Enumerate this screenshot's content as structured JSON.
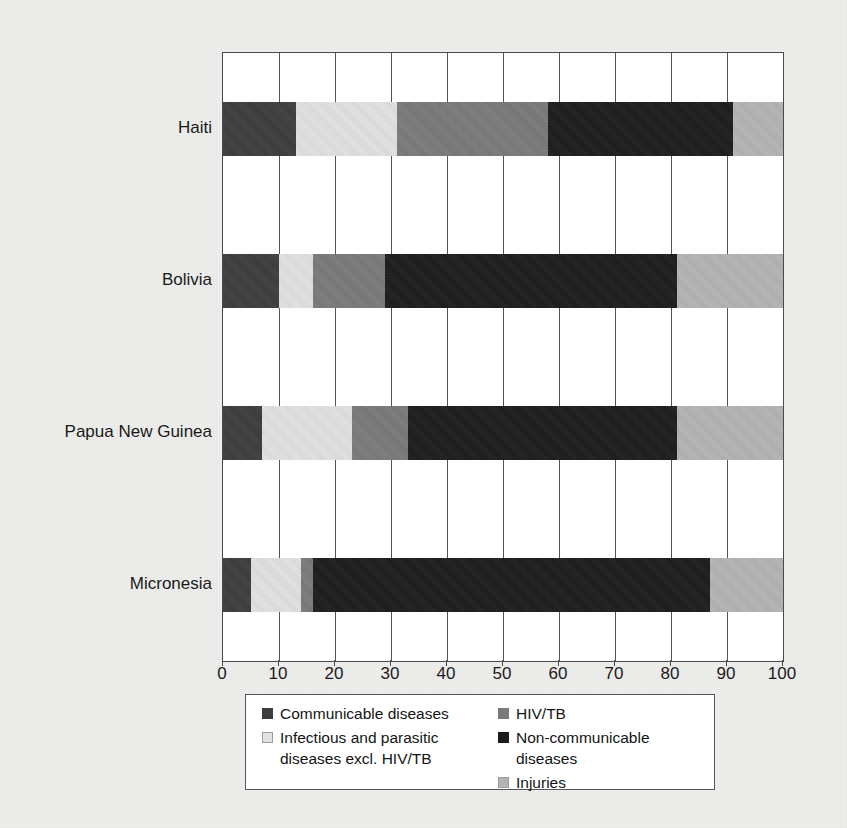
{
  "chart_data": {
    "type": "bar",
    "orientation": "horizontal",
    "stacked": true,
    "normalized_percent": true,
    "title": "",
    "subtitle": "",
    "xlabel": "",
    "ylabel": "",
    "xlim": [
      0,
      100
    ],
    "grid": true,
    "legend_position": "bottom",
    "xticks": [
      0,
      10,
      20,
      30,
      40,
      50,
      60,
      70,
      80,
      90,
      100
    ],
    "xtick_labels": [
      "0",
      "10",
      "20",
      "30",
      "40",
      "50",
      "60",
      "70",
      "80",
      "90",
      "100"
    ],
    "categories": [
      "Haiti",
      "Bolivia",
      "Papua New Guinea",
      "Micronesia"
    ],
    "series": [
      {
        "name": "Communicable diseases",
        "color": "#3d3d3d",
        "values": [
          13,
          10,
          7,
          5
        ]
      },
      {
        "name": "Infectious and parasitic diseases excl. HIV/TB",
        "color": "#e2e2e2",
        "values": [
          18,
          6,
          16,
          9
        ]
      },
      {
        "name": "HIV/TB",
        "color": "#7a7a7a",
        "values": [
          27,
          13,
          10,
          2
        ]
      },
      {
        "name": "Non-communicable diseases",
        "color": "#1c1c1c",
        "values": [
          33,
          52,
          48,
          71
        ]
      },
      {
        "name": "Injuries",
        "color": "#b4b4b4",
        "values": [
          9,
          19,
          19,
          13
        ]
      }
    ]
  },
  "legend": {
    "entries": [
      {
        "label": "Communicable diseases",
        "color": "#3d3d3d",
        "column": 0
      },
      {
        "label": "HIV/TB",
        "color": "#7a7a7a",
        "column": 1
      },
      {
        "label": "Infectious and parasitic\ndiseases excl. HIV/TB",
        "color": "#e2e2e2",
        "column": 0
      },
      {
        "label": "Non-communicable diseases",
        "color": "#1c1c1c",
        "column": 1
      },
      {
        "label": "Injuries",
        "color": "#b4b4b4",
        "column": 1
      }
    ]
  }
}
